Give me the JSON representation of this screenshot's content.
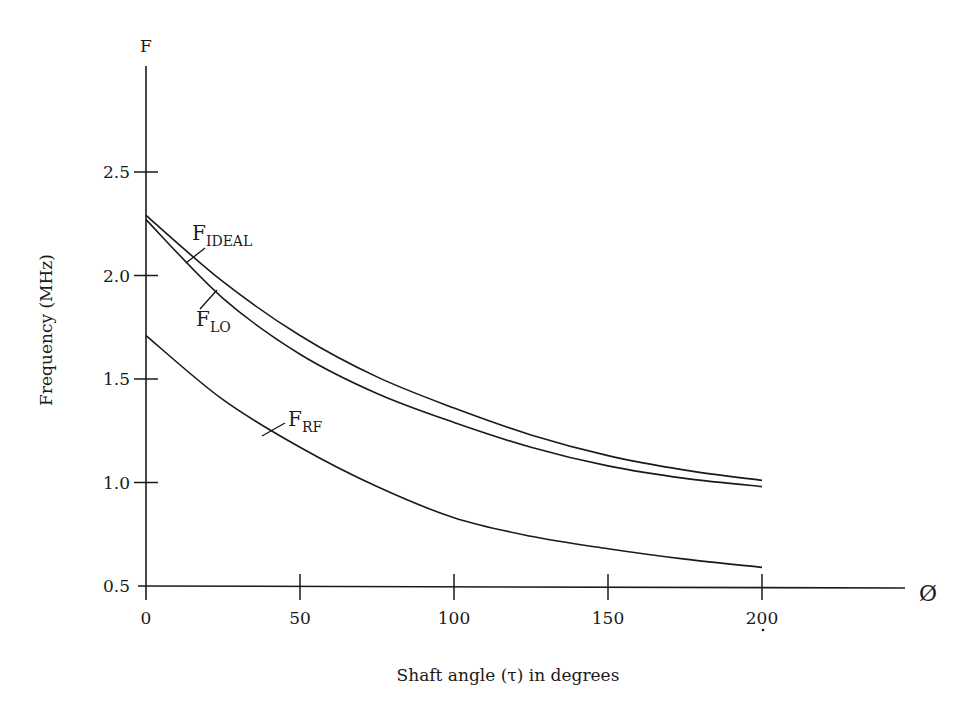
{
  "chart_data": {
    "type": "line",
    "title": "",
    "xlabel": "Shaft angle (τ) in degrees",
    "ylabel": "Frequency (MHz)",
    "y_axis_symbol": "F",
    "x_axis_symbol": "Ø",
    "xlim": [
      0,
      245
    ],
    "ylim": [
      0.5,
      2.95
    ],
    "x_ticks": [
      0,
      50,
      100,
      150,
      200
    ],
    "x_tick_labels": [
      "0",
      "50",
      "100",
      "150",
      "200"
    ],
    "y_ticks": [
      0.5,
      1.0,
      1.5,
      2.0,
      2.5
    ],
    "y_tick_labels": [
      "0.5",
      "1.0",
      "1.5",
      "2.0",
      "2.5"
    ],
    "grid": false,
    "legend": "inline labels with leader lines",
    "x": [
      0,
      25,
      50,
      75,
      100,
      125,
      150,
      175,
      200
    ],
    "series": [
      {
        "name": "F_IDEAL",
        "label_main": "F",
        "label_sub": "IDEAL",
        "values": [
          2.29,
          1.97,
          1.71,
          1.51,
          1.36,
          1.23,
          1.13,
          1.06,
          1.01
        ]
      },
      {
        "name": "F_LO",
        "label_main": "F",
        "label_sub": "LO",
        "values": [
          2.27,
          1.89,
          1.62,
          1.43,
          1.29,
          1.17,
          1.08,
          1.02,
          0.98
        ]
      },
      {
        "name": "F_RF",
        "label_main": "F",
        "label_sub": "RF",
        "values": [
          1.71,
          1.4,
          1.17,
          0.98,
          0.83,
          0.74,
          0.68,
          0.63,
          0.59
        ]
      }
    ]
  },
  "style": {
    "line_color": "#1a1a1a",
    "background": "#ffffff"
  }
}
